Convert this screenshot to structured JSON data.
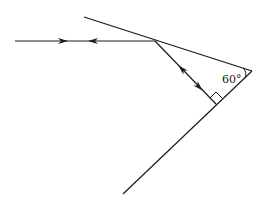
{
  "diagram": {
    "type": "ray-reflection-two-mirrors",
    "angle_label": "60°",
    "colors": {
      "stroke": "#1a1a1a",
      "background": "#ffffff"
    },
    "mirrors": [
      {
        "name": "upper-mirror",
        "from": [
          84,
          17
        ],
        "to": [
          252,
          71
        ]
      },
      {
        "name": "lower-mirror",
        "from": [
          252,
          71
        ],
        "to": [
          123,
          194
        ]
      }
    ],
    "rays": [
      {
        "name": "incident-reflected-horizontal",
        "from": [
          15,
          41
        ],
        "to": [
          155,
          41
        ],
        "arrows": [
          "right",
          "left"
        ]
      },
      {
        "name": "normal-incidence-segment",
        "from": [
          155,
          41
        ],
        "to": [
          216,
          104
        ],
        "arrows": [
          "up-left",
          "down-right"
        ]
      }
    ],
    "markers": {
      "right_angle": "perpendicular incidence on lower mirror",
      "angle_between_mirrors": "60°"
    }
  }
}
